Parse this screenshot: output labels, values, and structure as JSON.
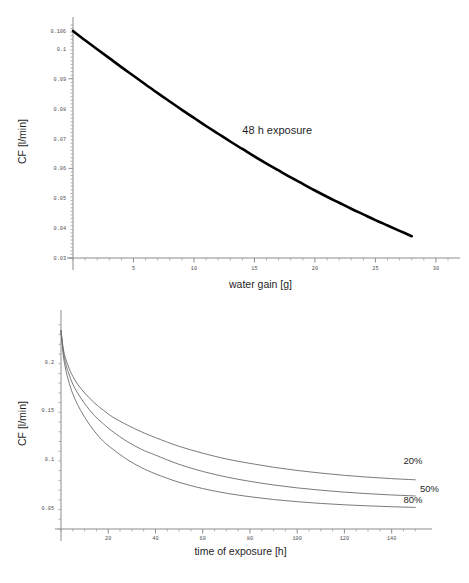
{
  "chart_data": [
    {
      "id": "top",
      "type": "line",
      "title": "",
      "xlabel": "water gain [g]",
      "ylabel": "CF [l/min]",
      "xlim": [
        0,
        31
      ],
      "ylim": [
        0.03,
        0.108
      ],
      "grid": false,
      "legend_position": "none",
      "xticks": [
        5,
        10,
        15,
        20,
        25,
        30
      ],
      "xticklabels": [
        "5",
        "10",
        "15",
        "20",
        "25",
        "30"
      ],
      "yticks": [
        0.03,
        0.04,
        0.05,
        0.06,
        0.07,
        0.08,
        0.09,
        0.1,
        0.106
      ],
      "yticklabels": [
        "0.03",
        "0.04",
        "0.05",
        "0.06",
        "0.07",
        "0.08",
        "0.09",
        "0.1",
        "0.106"
      ],
      "annotations": [
        {
          "text": "48 h exposure",
          "x": 14.0,
          "y": 0.0715
        }
      ],
      "series": [
        {
          "name": "48 h exposure",
          "x": [
            0,
            1,
            2,
            3,
            4,
            5,
            6,
            7,
            8,
            9,
            10,
            11,
            12,
            13,
            14,
            15,
            16,
            17,
            18,
            19,
            20,
            21,
            22,
            23,
            24,
            25,
            26,
            27,
            28
          ],
          "values": [
            0.106,
            0.1029,
            0.0999,
            0.0969,
            0.0939,
            0.091,
            0.0881,
            0.0852,
            0.0824,
            0.0796,
            0.0769,
            0.0742,
            0.0716,
            0.069,
            0.0665,
            0.064,
            0.0616,
            0.0593,
            0.057,
            0.0548,
            0.0526,
            0.0505,
            0.0485,
            0.0465,
            0.0446,
            0.0427,
            0.0409,
            0.0391,
            0.0373
          ]
        }
      ]
    },
    {
      "id": "bottom",
      "type": "line",
      "title": "",
      "xlabel": "time of exposure [h]",
      "ylabel": "CF [l/min]",
      "xlim": [
        0,
        152
      ],
      "ylim": [
        0.028,
        0.245
      ],
      "grid": false,
      "legend_position": "right-inline",
      "xticks": [
        20,
        40,
        60,
        80,
        100,
        120,
        140
      ],
      "xticklabels": [
        "20",
        "40",
        "60",
        "80",
        "100",
        "120",
        "140"
      ],
      "yticks": [
        0.05,
        0.1,
        0.15,
        0.2
      ],
      "yticklabels": [
        "0.05",
        "0.1",
        "0.15",
        "0.2"
      ],
      "annotations": [],
      "series": [
        {
          "name": "20%",
          "label": "20%",
          "label_x": 145,
          "label_y": 0.095,
          "x": [
            0,
            1,
            2,
            3,
            4,
            5,
            7,
            10,
            14,
            18,
            22,
            28,
            34,
            40,
            50,
            60,
            70,
            80,
            90,
            100,
            110,
            120,
            130,
            140,
            150
          ],
          "values": [
            0.232,
            0.213,
            0.203,
            0.196,
            0.19,
            0.185,
            0.177,
            0.168,
            0.158,
            0.15,
            0.143,
            0.135,
            0.128,
            0.122,
            0.113,
            0.106,
            0.1,
            0.0955,
            0.0915,
            0.0882,
            0.0855,
            0.0832,
            0.0813,
            0.0798,
            0.0786
          ]
        },
        {
          "name": "50%",
          "label": "50%",
          "label_x": 152,
          "label_y": 0.0665,
          "x": [
            0,
            1,
            2,
            3,
            4,
            5,
            7,
            10,
            14,
            18,
            22,
            28,
            34,
            40,
            50,
            60,
            70,
            80,
            90,
            100,
            110,
            120,
            130,
            140,
            150
          ],
          "values": [
            0.232,
            0.21,
            0.198,
            0.19,
            0.183,
            0.177,
            0.168,
            0.157,
            0.145,
            0.136,
            0.128,
            0.118,
            0.11,
            0.104,
            0.0945,
            0.0872,
            0.0815,
            0.077,
            0.0733,
            0.0703,
            0.0679,
            0.0659,
            0.0643,
            0.063,
            0.062
          ]
        },
        {
          "name": "80%",
          "label": "80%",
          "label_x": 145,
          "label_y": 0.0545,
          "x": [
            0,
            1,
            2,
            3,
            4,
            5,
            7,
            10,
            14,
            18,
            22,
            28,
            34,
            40,
            50,
            60,
            70,
            80,
            90,
            100,
            110,
            120,
            130,
            140,
            150
          ],
          "values": [
            0.232,
            0.206,
            0.192,
            0.182,
            0.174,
            0.167,
            0.156,
            0.143,
            0.129,
            0.118,
            0.11,
            0.0995,
            0.0912,
            0.0847,
            0.076,
            0.0696,
            0.0648,
            0.0612,
            0.0583,
            0.0561,
            0.0543,
            0.0529,
            0.0518,
            0.0509,
            0.0502
          ]
        }
      ]
    }
  ],
  "colors": {
    "curve_top": "#000000",
    "curve_bottom": "#6b6b6b",
    "axis": "#8c8c8c",
    "text": "#1f1f1f",
    "background": "#ffffff"
  }
}
